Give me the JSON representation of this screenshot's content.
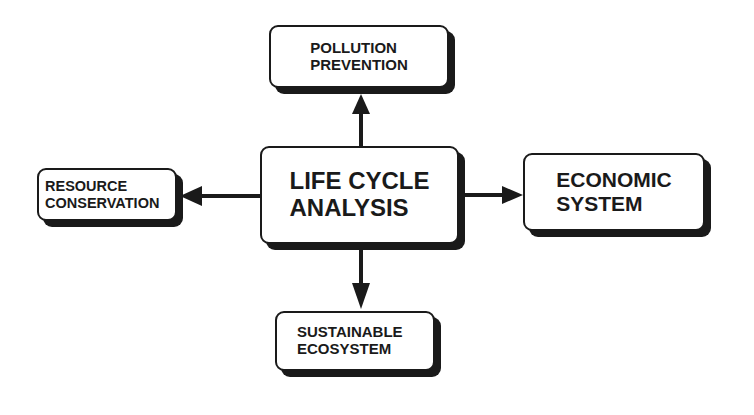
{
  "diagram": {
    "center": {
      "line1": "LIFE CYCLE",
      "line2": "ANALYSIS"
    },
    "top": {
      "line1": "POLLUTION",
      "line2": "PREVENTION"
    },
    "left": {
      "line1": "RESOURCE",
      "line2": "CONSERVATION"
    },
    "right": {
      "line1": "ECONOMIC",
      "line2": "SYSTEM"
    },
    "bottom": {
      "line1": "SUSTAINABLE",
      "line2": "ECOSYSTEM"
    },
    "edges": [
      {
        "from": "center",
        "to": "top"
      },
      {
        "from": "center",
        "to": "left"
      },
      {
        "from": "center",
        "to": "right"
      },
      {
        "from": "center",
        "to": "bottom"
      }
    ],
    "colors": {
      "ink": "#1a1a1a",
      "background": "#ffffff"
    }
  }
}
